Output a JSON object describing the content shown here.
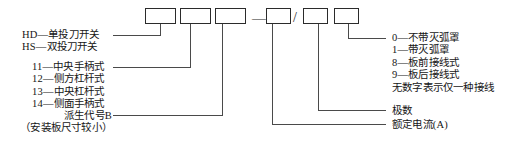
{
  "diagram": {
    "type": "model-designation-breakdown",
    "separators": {
      "dash": "—",
      "slash": "/"
    },
    "boxes": [
      {
        "name": "box-series",
        "value": ""
      },
      {
        "name": "box-design",
        "value": ""
      },
      {
        "name": "box-derivative",
        "value": ""
      },
      {
        "name": "box-current",
        "value": ""
      },
      {
        "name": "box-poles",
        "value": ""
      },
      {
        "name": "box-wiring",
        "value": ""
      }
    ],
    "left_labels": {
      "series": [
        "HD—单投刀开关",
        "HS—双投刀开关"
      ],
      "operation": [
        "11—中央手柄式",
        "12—侧方杠杆式",
        "13—中央杠杆式",
        "14—侧面手柄式"
      ],
      "derivative": [
        "派生代号B",
        "（安装板尺寸较小）"
      ]
    },
    "right_labels": {
      "wiring": [
        "0—不带灭弧罩",
        "1—带灭弧罩",
        "8—板前接线式",
        "9—板后接线式",
        "无数字表示仅一种接线"
      ],
      "poles": "极数",
      "current": "额定电流(A)"
    },
    "colors": {
      "line": "#2b2b2b",
      "text": "#161616",
      "background": "#ffffff"
    }
  }
}
